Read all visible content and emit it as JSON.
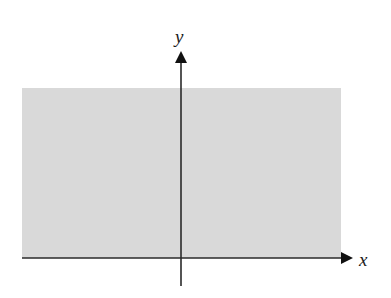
{
  "diagram": {
    "title": "",
    "region": {
      "description": "shaded half-plane region above the x-axis",
      "fill": "#d9d9d9",
      "left": 22,
      "top": 88,
      "right": 341,
      "bottom": 258
    },
    "axes": {
      "color": "#1a1a1a",
      "x_axis": {
        "label": "x",
        "y": 258,
        "x_start": 22,
        "x_end": 352
      },
      "y_axis": {
        "label": "y",
        "x": 181,
        "y_start": 286,
        "y_end": 52
      }
    }
  }
}
